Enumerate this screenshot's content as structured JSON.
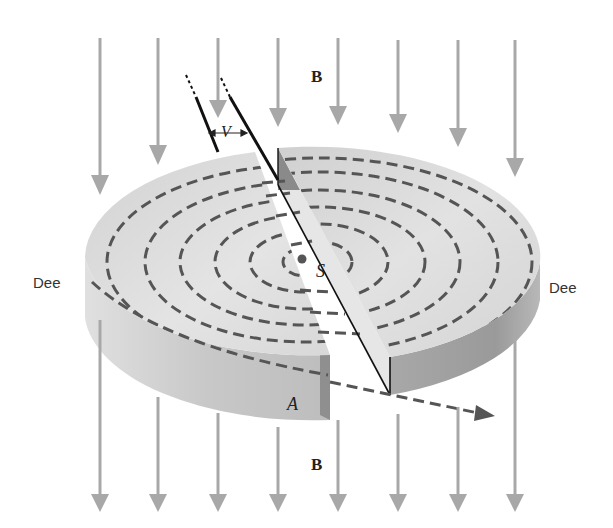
{
  "diagram": {
    "type": "cyclotron-schematic",
    "labels": {
      "field_top": "B",
      "field_bottom": "B",
      "voltage": "V",
      "source": "S",
      "exit_point": "A",
      "dee_left": "Dee",
      "dee_right": "Dee"
    },
    "field_arrows": {
      "direction": "down",
      "count_top": 8,
      "count_bottom": 8,
      "color": "#a8a8a8"
    },
    "orbits": {
      "style": "dashed",
      "count": 6,
      "color": "#555555"
    },
    "colors": {
      "dee_top": "#d9d9d9",
      "dee_side_left": "#c4c4c4",
      "dee_side_right": "#9a9a9a",
      "gap": "#f2f2f2",
      "electrode_line": "#111111",
      "exit_path": "#555555"
    }
  }
}
